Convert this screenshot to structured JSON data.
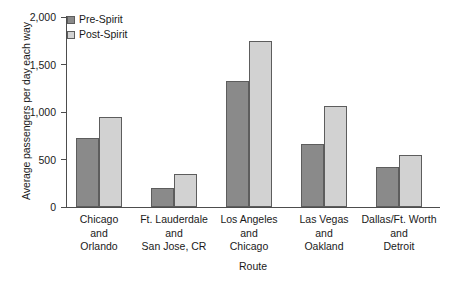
{
  "chart_data": {
    "type": "bar",
    "title": "",
    "xlabel": "Route",
    "ylabel": "Average passengers per day each way",
    "categories": [
      "Chicago\nand\nOrlando",
      "Ft. Lauderdale\nand\nSan Jose, CR",
      "Los Angeles\nand\nChicago",
      "Las Vegas\nand\nOakland",
      "Dallas/Ft. Worth\nand\nDetroit"
    ],
    "series": [
      {
        "name": "Pre-Spirit",
        "values": [
          730,
          200,
          1330,
          660,
          420
        ],
        "color": "#8a8a8a"
      },
      {
        "name": "Post-Spirit",
        "values": [
          950,
          350,
          1750,
          1060,
          550
        ],
        "color": "#d2d2d2"
      }
    ],
    "ylim": [
      0,
      2000
    ],
    "yticks": [
      0,
      500,
      1000,
      1500,
      2000
    ],
    "ytick_labels": [
      "0",
      "500",
      "1,000",
      "1,500",
      "2,000"
    ],
    "grid": false,
    "legend_position": "top-left"
  },
  "legend": {
    "items": [
      {
        "label": "Pre-Spirit"
      },
      {
        "label": "Post-Spirit"
      }
    ]
  }
}
